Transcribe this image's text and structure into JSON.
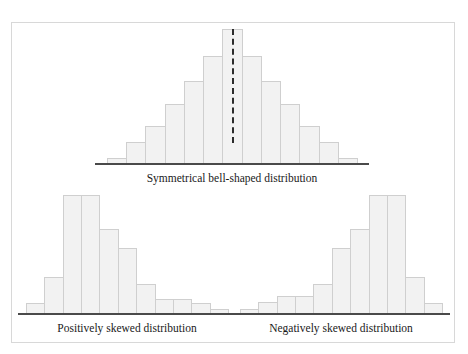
{
  "figure": {
    "background_color": "#ffffff",
    "frame_border_color": "#d8d8d8",
    "bar_fill_color": "#f2f2f2",
    "bar_border_color": "#cfcfcf",
    "axis_color": "#4a4a4a",
    "median_line_color": "#2b2b2b"
  },
  "panels": [
    {
      "id": "symmetrical",
      "caption": "Symmetrical bell-shaped distribution",
      "median_marker": true
    },
    {
      "id": "positive",
      "caption": "Positively skewed distribution",
      "median_marker": false
    },
    {
      "id": "negative",
      "caption": "Negatively skewed distribution",
      "median_marker": false
    }
  ],
  "chart_data": [
    {
      "type": "bar",
      "title": "Symmetrical bell-shaped distribution",
      "xlabel": "",
      "ylabel": "",
      "grid": false,
      "legend": "none",
      "categories": [
        "1",
        "2",
        "3",
        "4",
        "5",
        "6",
        "7",
        "8",
        "9",
        "10",
        "11",
        "12",
        "13"
      ],
      "values": [
        5,
        17,
        29,
        45,
        62,
        80,
        100,
        80,
        62,
        45,
        29,
        17,
        5
      ],
      "ylim": [
        0,
        100
      ],
      "annotations": [
        {
          "type": "vertical-dashed-line",
          "label": "median",
          "at_category": "7"
        }
      ]
    },
    {
      "type": "bar",
      "title": "Positively skewed distribution",
      "xlabel": "",
      "ylabel": "",
      "grid": false,
      "legend": "none",
      "categories": [
        "1",
        "2",
        "3",
        "4",
        "5",
        "6",
        "7",
        "8",
        "9",
        "10",
        "11"
      ],
      "values": [
        10,
        32,
        100,
        100,
        72,
        56,
        26,
        13,
        13,
        10,
        5
      ],
      "ylim": [
        0,
        100
      ]
    },
    {
      "type": "bar",
      "title": "Negatively skewed distribution",
      "xlabel": "",
      "ylabel": "",
      "grid": false,
      "legend": "none",
      "categories": [
        "1",
        "2",
        "3",
        "4",
        "5",
        "6",
        "7",
        "8",
        "9",
        "10",
        "11"
      ],
      "values": [
        5,
        11,
        16,
        16,
        26,
        56,
        72,
        100,
        100,
        32,
        10
      ],
      "ylim": [
        0,
        100
      ]
    }
  ]
}
